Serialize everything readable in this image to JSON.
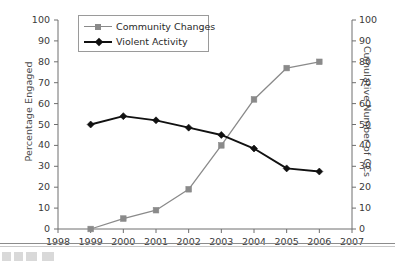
{
  "chart_data": {
    "type": "line",
    "title": "",
    "xlabel": "",
    "ylabel": "Percentage Engaged",
    "y2label": "Cumulative Number of CCs",
    "x": [
      1999,
      2000,
      2001,
      2002,
      2003,
      2004,
      2005,
      2006
    ],
    "xticks": [
      1998,
      1999,
      2000,
      2001,
      2002,
      2003,
      2004,
      2005,
      2006,
      2007
    ],
    "xlim": [
      1998,
      2007
    ],
    "yticks": [
      0,
      10,
      20,
      30,
      40,
      50,
      60,
      70,
      80,
      90,
      100
    ],
    "ylim": [
      0,
      100
    ],
    "y2ticks": [
      0,
      10,
      20,
      30,
      40,
      50,
      60,
      70,
      80,
      90,
      100
    ],
    "y2lim": [
      0,
      100
    ],
    "grid": false,
    "legend_position": "top-left",
    "series": [
      {
        "name": "Community Changes",
        "color": "#8a8a8a",
        "marker": "square",
        "axis": "right",
        "values": [
          0,
          5,
          9,
          19,
          40,
          62,
          77,
          80
        ]
      },
      {
        "name": "Violent Activity",
        "color": "#111111",
        "marker": "diamond",
        "axis": "left",
        "values": [
          50,
          54,
          52,
          48.5,
          45,
          38.5,
          29,
          27.5
        ]
      }
    ]
  },
  "axes": {
    "left_title": "Percentage Engaged",
    "right_title": "Cumulative Number of CCs",
    "left_ticks": [
      "100",
      "90",
      "80",
      "70",
      "60",
      "50",
      "40",
      "30",
      "20",
      "10",
      "0"
    ],
    "right_ticks": [
      "100",
      "90",
      "80",
      "70",
      "60",
      "50",
      "40",
      "30",
      "20",
      "10",
      "0"
    ],
    "x_ticks": [
      "1998",
      "1999",
      "2000",
      "2001",
      "2002",
      "2003",
      "2004",
      "2005",
      "2006",
      "2007"
    ]
  },
  "legend": {
    "entries": [
      {
        "label": "Community Changes",
        "color": "#8a8a8a",
        "marker": "square"
      },
      {
        "label": "Violent Activity",
        "color": "#111111",
        "marker": "diamond"
      }
    ]
  },
  "colors": {
    "community_changes": "#8a8a8a",
    "violent_activity": "#111111",
    "axis": "#6e6e6e",
    "text": "#2a2a2a"
  }
}
